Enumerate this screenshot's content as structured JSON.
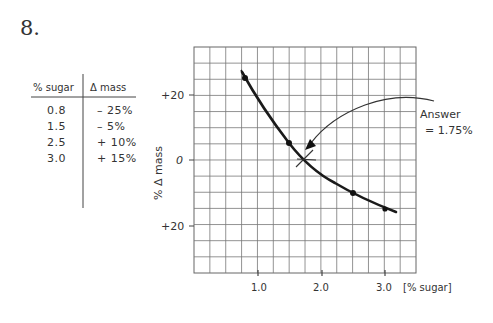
{
  "problem": {
    "number": "8."
  },
  "table": {
    "headers": [
      "% sugar",
      "Δ mass"
    ],
    "rows": [
      [
        "0.8",
        "– 25%"
      ],
      [
        "1.5",
        "– 5%"
      ],
      [
        "2.5",
        "+ 10%"
      ],
      [
        "3.0",
        "+ 15%"
      ]
    ]
  },
  "graph": {
    "y_axis_label": "% Δ mass",
    "x_axis_label": "[% sugar]",
    "y_ticks": [
      "+20",
      "0",
      "+20"
    ],
    "x_ticks": [
      "1.0",
      "2.0",
      "3.0"
    ],
    "annotation_line1": "Answer",
    "annotation_line2": "= 1.75%"
  },
  "chart_data": {
    "type": "line",
    "title": "",
    "xlabel": "% sugar",
    "ylabel": "% Δ mass",
    "x": [
      0.8,
      1.5,
      2.5,
      3.0
    ],
    "series": [
      {
        "name": "Δ mass",
        "values": [
          25,
          5,
          -10,
          -15
        ]
      }
    ],
    "xlim": [
      0,
      3.5
    ],
    "ylim": [
      -35,
      35
    ],
    "x_ticks": [
      1.0,
      2.0,
      3.0
    ],
    "y_ticks_labels": [
      "+20",
      "0",
      "+20"
    ],
    "grid": true,
    "annotations": [
      {
        "text": "Answer = 1.75%",
        "x": 1.75,
        "y": 0,
        "marker": "x",
        "arrow": true
      }
    ],
    "note": "Table lists 0.8 → −25%, 1.5 → −5%, 2.5 → +10%, 3.0 → +15%; plotted with positive values above the 0 line for low sugar."
  }
}
